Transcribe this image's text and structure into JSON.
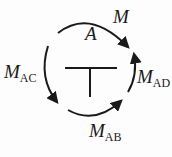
{
  "diagram": {
    "type": "joint-moment-equilibrium",
    "joint_label": "A",
    "stroke_color": "#1a1a1a",
    "labels": {
      "applied_moment": {
        "main": "M",
        "sub": ""
      },
      "joint": {
        "main": "A",
        "sub": ""
      },
      "m_ac": {
        "main": "M",
        "sub": "AC"
      },
      "m_ad": {
        "main": "M",
        "sub": "AD"
      },
      "m_ab": {
        "main": "M",
        "sub": "AB"
      }
    },
    "arrows": [
      {
        "name": "applied-moment-arrow",
        "direction": "clockwise"
      },
      {
        "name": "m-ac-arrow",
        "direction": "counterclockwise"
      },
      {
        "name": "m-ab-arrow",
        "direction": "counterclockwise"
      },
      {
        "name": "m-ad-arrow",
        "direction": "counterclockwise"
      }
    ],
    "joint_shape": "T-junction"
  }
}
